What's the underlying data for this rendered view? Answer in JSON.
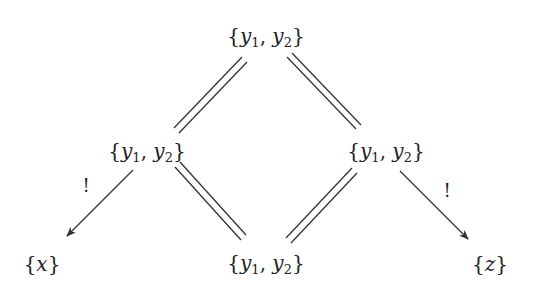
{
  "diagram": {
    "nodes": [
      {
        "id": "top",
        "label": "{y1, y2}",
        "x": 266,
        "y": 37
      },
      {
        "id": "mid-left",
        "label": "{y1, y2}",
        "x": 147,
        "y": 152
      },
      {
        "id": "mid-right",
        "label": "{y1, y2}",
        "x": 386,
        "y": 152
      },
      {
        "id": "bottom-left",
        "label": "{x}",
        "x": 42,
        "y": 264
      },
      {
        "id": "bottom-center",
        "label": "{y1, y2}",
        "x": 266,
        "y": 264
      },
      {
        "id": "bottom-right",
        "label": "{z}",
        "x": 490,
        "y": 264
      }
    ],
    "edges": [
      {
        "from": "top",
        "to": "mid-left",
        "style": "double-line"
      },
      {
        "from": "top",
        "to": "mid-right",
        "style": "double-line"
      },
      {
        "from": "mid-left",
        "to": "bottom-center",
        "style": "double-line"
      },
      {
        "from": "mid-right",
        "to": "bottom-center",
        "style": "double-line"
      },
      {
        "from": "mid-left",
        "to": "bottom-left",
        "style": "arrow",
        "label": "!"
      },
      {
        "from": "mid-right",
        "to": "bottom-right",
        "style": "arrow",
        "label": "!"
      }
    ],
    "edge_labels": {
      "left": "!",
      "right": "!"
    },
    "symbols": {
      "var_y": "y",
      "sub1": "1",
      "sub2": "2",
      "var_x": "x",
      "var_z": "z",
      "lbrace": "{",
      "rbrace": "}",
      "comma": ", "
    }
  }
}
